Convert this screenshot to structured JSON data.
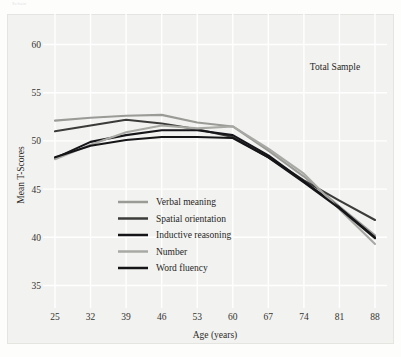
{
  "figure": {
    "background_color": "#fdfdfc",
    "plot_background_color": "#f2f2f0",
    "grid_color": "#ffffff",
    "corner_mark": "Schaie"
  },
  "chart_data": {
    "type": "line",
    "title": "",
    "annotation": "Total Sample",
    "xlabel": "Age (years)",
    "ylabel": "Mean T-Scores",
    "grid": true,
    "legend_position": "inside-lower-left",
    "x": [
      25,
      32,
      39,
      46,
      53,
      60,
      67,
      74,
      81,
      88
    ],
    "xtick_labels": [
      "25",
      "32",
      "39",
      "46",
      "53",
      "60",
      "67",
      "74",
      "81",
      "88"
    ],
    "ytick_labels": [
      "35",
      "40",
      "45",
      "50",
      "55",
      "60"
    ],
    "yticks": [
      35,
      40,
      45,
      50,
      55,
      60
    ],
    "xlim": [
      25,
      88
    ],
    "ylim": [
      33.5,
      61.5
    ],
    "series": [
      {
        "name": "Verbal meaning",
        "color": "#9a9a97",
        "width": 2.1,
        "values": [
          52.1,
          52.4,
          52.6,
          52.7,
          51.9,
          51.5,
          49.0,
          46.3,
          43.2,
          40.2
        ]
      },
      {
        "name": "Spatial orientation",
        "color": "#3b3b39",
        "width": 2.1,
        "values": [
          51.0,
          51.6,
          52.2,
          51.8,
          51.2,
          50.4,
          48.3,
          45.9,
          43.8,
          41.8
        ]
      },
      {
        "name": "Inductive reasoning",
        "color": "#16161a",
        "width": 2.1,
        "values": [
          48.2,
          49.9,
          50.6,
          51.1,
          51.1,
          50.6,
          48.5,
          45.8,
          43.1,
          40.0
        ]
      },
      {
        "name": "Number",
        "color": "#a8a8a4",
        "width": 2.1,
        "values": [
          48.1,
          49.6,
          50.9,
          51.6,
          51.3,
          51.5,
          49.2,
          46.6,
          42.9,
          39.3
        ]
      },
      {
        "name": "Word fluency",
        "color": "#151518",
        "width": 2.1,
        "values": [
          48.3,
          49.5,
          50.1,
          50.4,
          50.4,
          50.3,
          48.3,
          45.7,
          43.0,
          39.9
        ]
      }
    ]
  }
}
